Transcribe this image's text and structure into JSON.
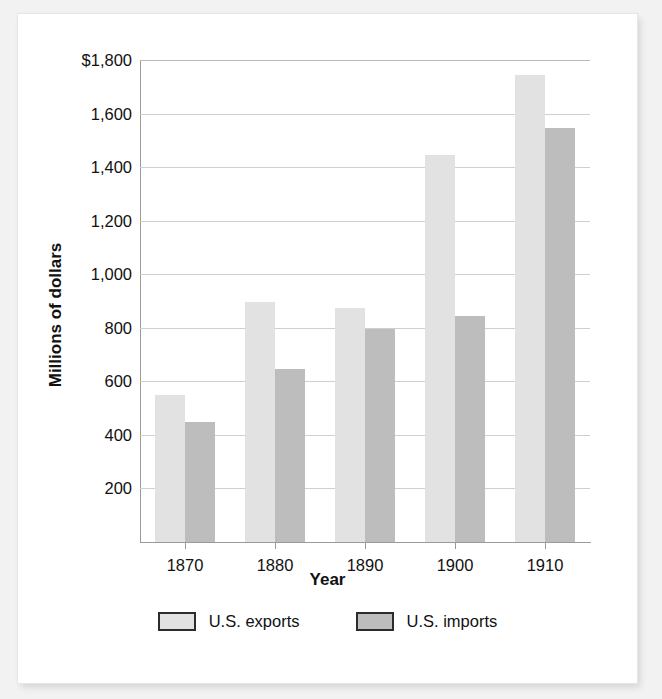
{
  "chart_data": {
    "type": "bar",
    "title": "",
    "xlabel": "Year",
    "ylabel": "Millions of dollars",
    "categories": [
      "1870",
      "1880",
      "1890",
      "1900",
      "1910"
    ],
    "series": [
      {
        "name": "U.S. exports",
        "color": "#e2e2e2",
        "values": [
          550,
          895,
          875,
          1445,
          1745
        ]
      },
      {
        "name": "U.S. imports",
        "color": "#bdbdbd",
        "values": [
          450,
          645,
          795,
          845,
          1545
        ]
      }
    ],
    "ylim": [
      0,
      1800
    ],
    "ytick_values": [
      200,
      400,
      600,
      800,
      1000,
      1200,
      1400,
      1600,
      1800
    ],
    "ytick_labels": [
      "200",
      "400",
      "600",
      "800",
      "1,000",
      "1,200",
      "1,400",
      "1,600",
      "$1,800"
    ],
    "grid": true,
    "legend_position": "bottom"
  },
  "legend": {
    "entries": [
      {
        "label": "U.S. exports",
        "swatch": "exports-swatch"
      },
      {
        "label": "U.S. imports",
        "swatch": "imports-swatch"
      }
    ]
  },
  "colors": {
    "exports": "#e2e2e2",
    "imports": "#bdbdbd",
    "gridline": "#cfcfcf",
    "axis": "#9a9a9a",
    "text": "#111111",
    "page_background": "#f2f2f2",
    "card_background": "#ffffff"
  }
}
